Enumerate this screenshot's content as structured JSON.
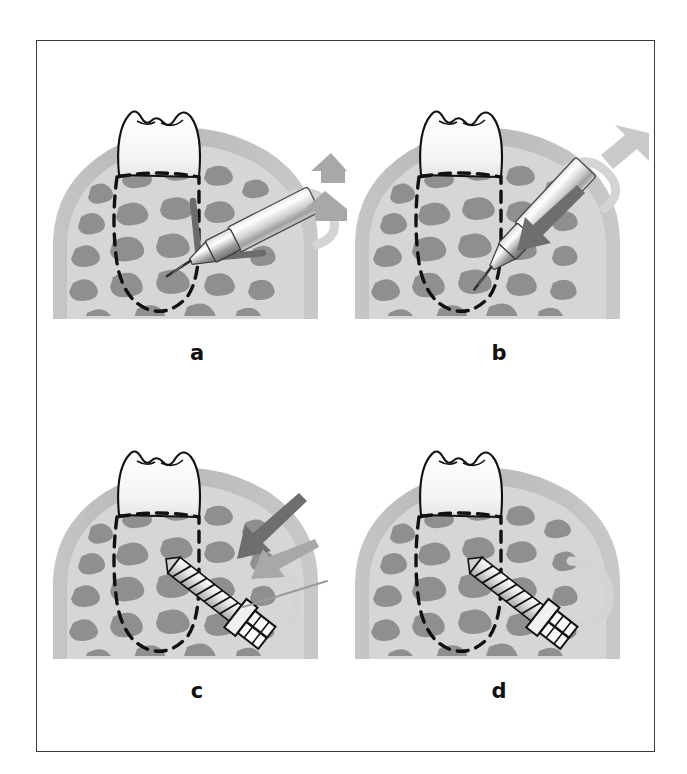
{
  "figure": {
    "frame_color": "#3a3a3a",
    "background": "#ffffff",
    "panel_count": 4
  },
  "palette": {
    "outline_black": "#111111",
    "bone_cortical": "#b9b9b9",
    "bone_cancellous_bg": "#d8d8d8",
    "trabecula_gray": "#8f8f8f",
    "tooth_enamel": "#fbfbfb",
    "tooth_shadow": "#ececec",
    "arrow_dark": "#6e6e6e",
    "arrow_mid": "#a8a8a8",
    "arrow_light": "#c9c9c9",
    "loop_light": "#d4d4d4",
    "metal_light": "#fafafa",
    "metal_mid": "#c0c0c0",
    "metal_dark": "#7d7d7d",
    "angle_marker": "#6b6b6b"
  },
  "panels": [
    {
      "id": "a",
      "label": "a",
      "caption_letter": "a",
      "stage": "perpendicular-pilot-drilling",
      "description": "Handpiece with pilot bur held perpendicular to bone surface; right-angle reference marker shown; rotation loop and two push arrows indicate rotating drill advanced toward bone",
      "elements": {
        "tooth": true,
        "bone": true,
        "root_outline_dashed": true,
        "handpiece": true,
        "drill_bur": true,
        "screw": false,
        "rotation_loop": true,
        "angle_marker": true
      },
      "arrows": [
        {
          "name": "push-arrow-upper",
          "color": "#a8a8a8",
          "direction": "left",
          "style": "block"
        },
        {
          "name": "push-arrow-lower",
          "color": "#a8a8a8",
          "direction": "left",
          "style": "block"
        }
      ]
    },
    {
      "id": "b",
      "label": "b",
      "caption_letter": "b",
      "stage": "angled-drilling",
      "description": "Handpiece tilted to an oblique angle relative to bone; dark arrow shows apical insertion vector, light arrow and loop show continued rotation and pressure",
      "elements": {
        "tooth": true,
        "bone": true,
        "root_outline_dashed": true,
        "handpiece": true,
        "drill_bur": true,
        "screw": false,
        "rotation_loop": true,
        "angle_marker": false
      },
      "arrows": [
        {
          "name": "insertion-arrow",
          "color": "#6e6e6e",
          "direction": "down-left",
          "style": "slim"
        },
        {
          "name": "pressure-arrow",
          "color": "#c9c9c9",
          "direction": "down-left",
          "style": "block"
        }
      ]
    },
    {
      "id": "c",
      "label": "c",
      "caption_letter": "c",
      "stage": "miniscrew-insertion",
      "description": "Threaded miniscrew being driven into the prepared channel; dark arrow indicates insertion force, gray arrow and thin guideline indicate screw axis, loop indicates turning",
      "elements": {
        "tooth": true,
        "bone": true,
        "root_outline_dashed": true,
        "handpiece": false,
        "drill_bur": false,
        "screw": true,
        "rotation_loop": true,
        "angle_marker": false
      },
      "arrows": [
        {
          "name": "insertion-force-arrow",
          "color": "#6e6e6e",
          "direction": "down-left",
          "style": "slim"
        },
        {
          "name": "axis-arrow",
          "color": "#a8a8a8",
          "direction": "down-left",
          "style": "slim"
        },
        {
          "name": "axis-guideline",
          "color": "#9a9a9a",
          "direction": "down-left",
          "style": "line"
        }
      ]
    },
    {
      "id": "d",
      "label": "d",
      "caption_letter": "d",
      "stage": "miniscrew-seated",
      "description": "Miniscrew fully seated in bone between root and cortical plate; rotation loop shows final tightening turns; no directional force arrows remain",
      "elements": {
        "tooth": true,
        "bone": true,
        "root_outline_dashed": true,
        "handpiece": false,
        "drill_bur": false,
        "screw": true,
        "rotation_loop": true,
        "angle_marker": false
      },
      "arrows": []
    }
  ],
  "anatomy_legend": {
    "tooth": "molar crown and root",
    "cortical_bone": "outer dense bone shell",
    "cancellous_bone": "inner trabecular bone",
    "root_outline": "dashed line marking buried root contour"
  }
}
